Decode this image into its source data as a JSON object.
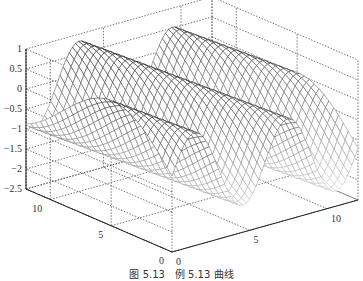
{
  "chart_data": {
    "type": "surface-mesh",
    "title": "",
    "caption": "图 5.13　例 5.13 曲线",
    "function": "z = sin(x), mesh surface over x in [0, 4π], y in [0, 12]",
    "x_axis": {
      "label": "",
      "ticks": [
        0,
        5,
        10
      ],
      "range": [
        0,
        12
      ]
    },
    "y_axis": {
      "label": "",
      "ticks": [
        0,
        5,
        10
      ],
      "range": [
        0,
        12
      ]
    },
    "z_axis": {
      "label": "",
      "ticks": [
        1,
        0.5,
        0,
        -0.5,
        -1,
        -1.5,
        -2,
        -2.5
      ],
      "tick_labels": [
        "1",
        "0.5",
        "0",
        "−0.5",
        "−1",
        "−1.5",
        "−2",
        "−2.5"
      ],
      "range": [
        -2.5,
        1
      ]
    },
    "grid": true,
    "grid_style": "dotted",
    "colormap": "gray",
    "mesh_resolution": {
      "nx": 60,
      "ny": 30
    }
  },
  "labels": {
    "caption": "图 5.13　例 5.13 曲线"
  }
}
